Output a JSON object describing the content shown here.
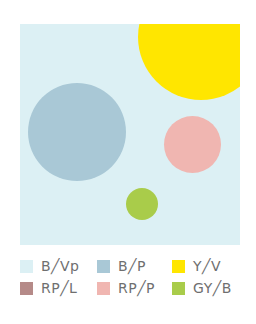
{
  "diagram": {
    "background_color": "#dcf0f4",
    "circles": [
      {
        "id": "B/P",
        "color": "#a9c8d6",
        "cx": 57,
        "cy": 108,
        "r": 49
      },
      {
        "id": "Y/V",
        "color": "#ffe600",
        "cx": 182,
        "cy": 14,
        "r": 62
      },
      {
        "id": "RP/P",
        "color": "#f0b6b1",
        "cx": 173,
        "cy": 121,
        "r": 28
      },
      {
        "id": "RP/L",
        "color": "#b58a88"
      },
      {
        "id": "GY/B",
        "color": "#a9cc4a",
        "cx": 122,
        "cy": 180,
        "r": 16
      }
    ]
  },
  "legend": {
    "items": [
      {
        "label": "B╱Vp",
        "color": "#dcf0f4"
      },
      {
        "label": "B╱P",
        "color": "#a9c8d6"
      },
      {
        "label": "Y╱V",
        "color": "#ffe600"
      },
      {
        "label": "RP╱L",
        "color": "#b58a88"
      },
      {
        "label": "RP╱P",
        "color": "#f0b6b1"
      },
      {
        "label": "GY╱B",
        "color": "#a9cc4a"
      }
    ]
  }
}
